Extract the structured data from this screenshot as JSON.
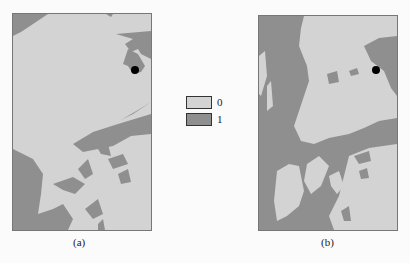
{
  "figure": {
    "panels": [
      {
        "id": "a",
        "caption": "(a)"
      },
      {
        "id": "b",
        "caption": "(b)"
      }
    ],
    "legend": [
      {
        "label": "0",
        "color": "#d3d3d3"
      },
      {
        "label": "1",
        "color": "#8f8f8f"
      }
    ],
    "colors": {
      "class_0": "#d3d3d3",
      "class_1": "#8f8f8f",
      "marker": "#000000"
    }
  }
}
